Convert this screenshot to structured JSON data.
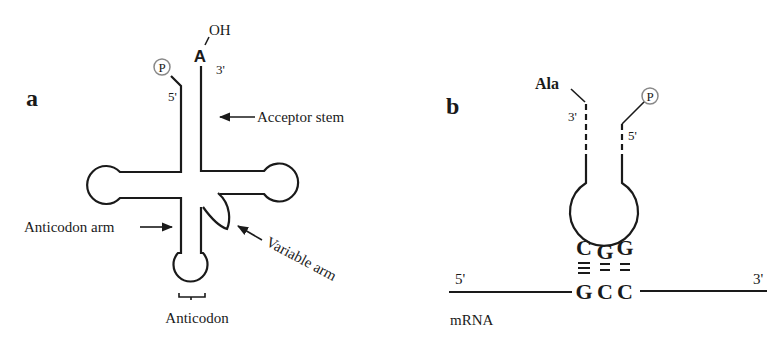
{
  "panel_a": {
    "label": "a",
    "terminal_3_base": "A",
    "terminal_3_group": "OH",
    "phosphate": "P",
    "five_prime": "5'",
    "three_prime": "3'",
    "labels": {
      "acceptor_stem": "Acceptor stem",
      "anticodon_arm": "Anticodon arm",
      "variable_arm": "Variable arm",
      "anticodon": "Anticodon"
    }
  },
  "panel_b": {
    "label": "b",
    "amino_acid": "Ala",
    "phosphate": "P",
    "trna_three_prime": "3'",
    "trna_five_prime": "5'",
    "anticodon_bases": [
      "C",
      "G",
      "G"
    ],
    "codon_bases": [
      "G",
      "C",
      "C"
    ],
    "mrna_five_prime": "5'",
    "mrna_three_prime": "3'",
    "mrna_label": "mRNA"
  },
  "colors": {
    "line": "#1a1a1a",
    "phosphate_circle": "#888888",
    "background": "#ffffff"
  }
}
